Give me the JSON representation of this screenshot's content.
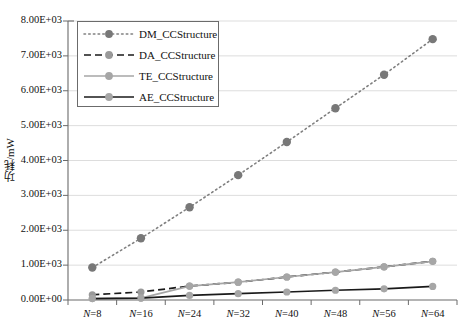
{
  "chart_data": {
    "type": "line",
    "title": "",
    "xlabel": "",
    "ylabel": "功耗/mW",
    "categories": [
      "N=8",
      "N=16",
      "N=24",
      "N=32",
      "N=40",
      "N=48",
      "N=56",
      "N=64"
    ],
    "ylim": [
      0,
      8000
    ],
    "ytick_labels": [
      "0.00E+00",
      "1.00E+03",
      "2.00E+03",
      "3.00E+03",
      "4.00E+03",
      "5.00E+03",
      "6.00E+03",
      "7.00E+03",
      "8.00E+03"
    ],
    "ytick_values": [
      0,
      1000,
      2000,
      3000,
      4000,
      5000,
      6000,
      7000,
      8000
    ],
    "grid": true,
    "legend_position": "top-left",
    "series": [
      {
        "name": "DM_CCStructure",
        "style": "dotted",
        "color": "#808080",
        "marker_color": "#787878",
        "values": [
          930,
          1770,
          2660,
          3580,
          4530,
          5500,
          6460,
          7480
        ]
      },
      {
        "name": "DA_CCStructure",
        "style": "dashed",
        "color": "#1a1a1a",
        "marker_color": "#9a9a9a",
        "values": [
          150,
          230,
          400,
          510,
          660,
          800,
          950,
          1110
        ]
      },
      {
        "name": "TE_CCStructure",
        "style": "solid",
        "color": "#a6a6a6",
        "marker_color": "#a6a6a6",
        "values": [
          40,
          55,
          400,
          510,
          660,
          800,
          950,
          1110
        ]
      },
      {
        "name": "AE_CCStructure",
        "style": "solid",
        "color": "#1a1a1a",
        "marker_color": "#a6a6a6",
        "values": [
          40,
          55,
          130,
          180,
          230,
          280,
          320,
          390
        ]
      }
    ]
  }
}
